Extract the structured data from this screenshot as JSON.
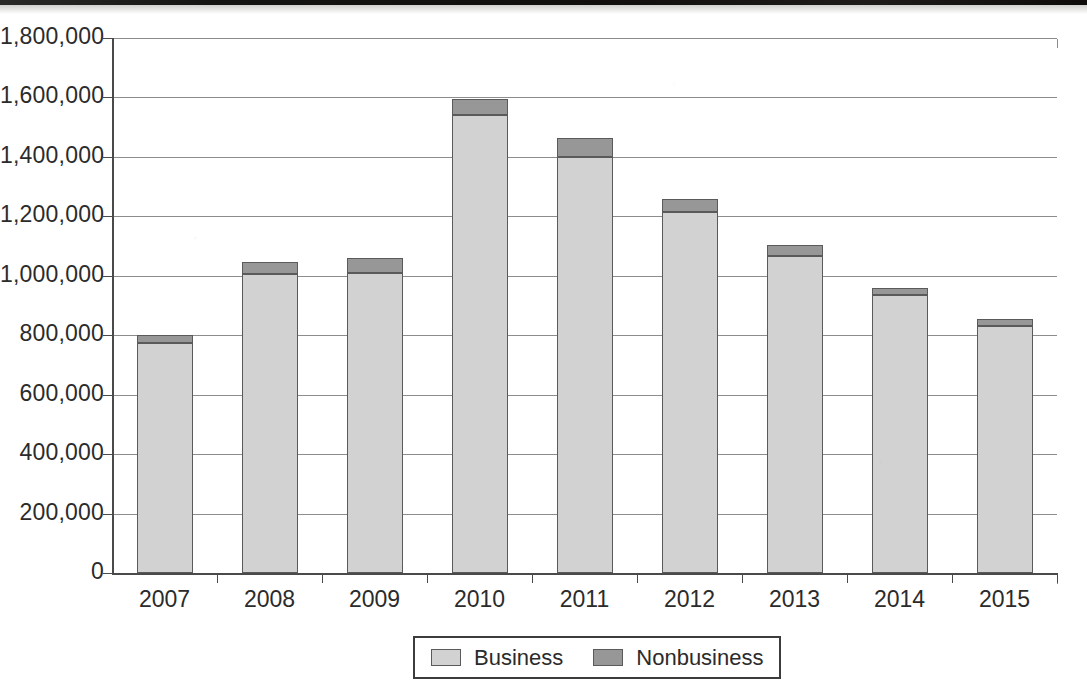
{
  "chart_data": {
    "type": "bar",
    "subtype": "stacked-bar",
    "title": "",
    "xlabel": "",
    "ylabel": "",
    "categories": [
      "2007",
      "2008",
      "2009",
      "2010",
      "2011",
      "2012",
      "2013",
      "2014",
      "2015"
    ],
    "series": [
      {
        "name": "Business",
        "color": "#d2d2d2",
        "values": [
          775000,
          1005000,
          1010000,
          1540000,
          1400000,
          1215000,
          1065000,
          935000,
          830000
        ]
      },
      {
        "name": "Nonbusiness",
        "color": "#979797",
        "values": [
          25000,
          40000,
          50000,
          55000,
          65000,
          45000,
          40000,
          25000,
          25000
        ]
      }
    ],
    "totals": [
      800000,
      1045000,
      1060000,
      1595000,
      1465000,
      1260000,
      1105000,
      960000,
      855000
    ],
    "ylim": [
      0,
      1800000
    ],
    "ytick_values": [
      0,
      200000,
      400000,
      600000,
      800000,
      1000000,
      1200000,
      1400000,
      1600000,
      1800000
    ],
    "ytick_labels": [
      "0",
      "200,000",
      "400,000",
      "600,000",
      "800,000",
      "1,000,000",
      "1,200,000",
      "1,400,000",
      "1,600,000",
      "1,800,000"
    ],
    "grid": true,
    "grid_axis": "y",
    "legend_position": "bottom",
    "legend_entries": [
      {
        "label": "Business",
        "color": "#d2d2d2"
      },
      {
        "label": "Nonbusiness",
        "color": "#979797"
      }
    ]
  },
  "legend": {
    "items": [
      {
        "label": "Business",
        "swatch_name": "legend-swatch-business"
      },
      {
        "label": "Nonbusiness",
        "swatch_name": "legend-swatch-nonbusiness"
      }
    ]
  },
  "axes": {
    "y_labels": [
      "1,800,000",
      "1,600,000",
      "1,400,000",
      "1,200,000",
      "1,000,000",
      "800,000",
      "600,000",
      "400,000",
      "200,000",
      "0"
    ],
    "x_labels": [
      "2007",
      "2008",
      "2009",
      "2010",
      "2011",
      "2012",
      "2013",
      "2014",
      "2015"
    ]
  },
  "colors": {
    "business": "#d2d2d2",
    "nonbusiness": "#979797",
    "bar_outline": "#5a5a5a",
    "gridline": "#8d8d8d",
    "axis": "#4a4a4a",
    "text": "#2b2b2b",
    "background": "#ffffff"
  }
}
